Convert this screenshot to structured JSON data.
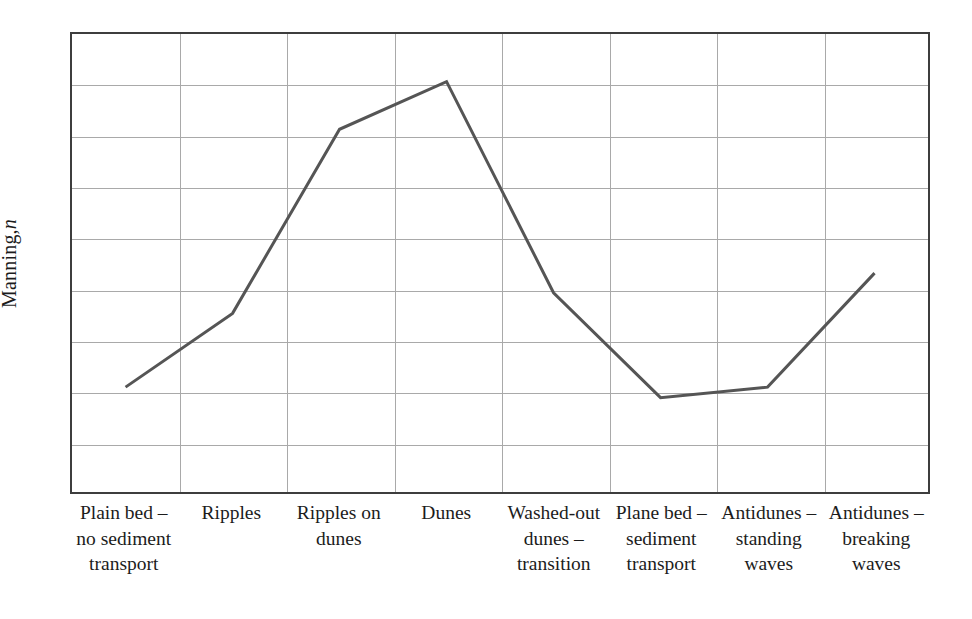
{
  "chart_data": {
    "type": "line",
    "title": "",
    "subtitle": "",
    "xlabel": "",
    "ylabel": "Manning, n",
    "ylabel_plain": "Manning,",
    "ylabel_italic": "n",
    "categories": [
      "Plain bed – no sediment transport",
      "Ripples",
      "Ripples on dunes",
      "Dunes",
      "Washed-out dunes – transition",
      "Plane bed – sediment transport",
      "Antidunes – standing waves",
      "Antidunes – breaking waves"
    ],
    "category_lines": [
      [
        "Plain bed –",
        "no sediment",
        "transport"
      ],
      [
        "Ripples"
      ],
      [
        "Ripples on",
        "dunes"
      ],
      [
        "Dunes"
      ],
      [
        "Washed-out",
        "dunes –",
        "transition"
      ],
      [
        "Plane bed –",
        "sediment",
        "transport"
      ],
      [
        "Antidunes –",
        "standing",
        "waves"
      ],
      [
        "Antidunes –",
        "breaking",
        "waves"
      ]
    ],
    "values": [
      0.229,
      0.39,
      0.792,
      0.896,
      0.435,
      0.206,
      0.229,
      0.478
    ],
    "value_units": "relative (axis unlabeled)",
    "ylim": [
      0,
      1
    ],
    "xtick_labels": [],
    "ytick_labels": [],
    "grid": true,
    "grid_rows": 9,
    "grid_cols": 8,
    "legend": null,
    "legend_position": "none",
    "annotations": [],
    "series": [
      {
        "name": "Manning n",
        "color": "#555555",
        "values": [
          0.229,
          0.39,
          0.792,
          0.896,
          0.435,
          0.206,
          0.229,
          0.478
        ]
      }
    ]
  },
  "style": {
    "line_color": "#555555",
    "frame_color": "#3d3d3d",
    "grid_color": "#a9a9a9",
    "text_color": "#1c1c1c",
    "background": "#ffffff",
    "line_width": 3
  }
}
